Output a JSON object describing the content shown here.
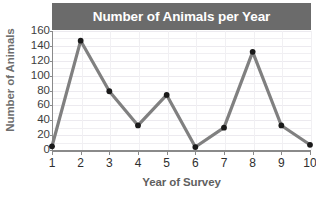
{
  "chart_data": {
    "type": "line",
    "title": "Number of Animals per Year",
    "xlabel": "Year of Survey",
    "ylabel": "Number of Animals",
    "x": [
      1,
      2,
      3,
      4,
      5,
      6,
      7,
      8,
      9,
      10
    ],
    "xticklabels": [
      "1",
      "2",
      "3",
      "4",
      "5",
      "6",
      "7",
      "8",
      "9",
      "10"
    ],
    "values": [
      5,
      147,
      79,
      33,
      74,
      4,
      30,
      132,
      33,
      7
    ],
    "yticks": [
      0,
      20,
      40,
      60,
      80,
      100,
      120,
      140,
      160
    ],
    "yticklabels": [
      "0",
      "20",
      "40",
      "60",
      "80",
      "100",
      "120",
      "140",
      "160"
    ],
    "ylim": [
      0,
      160
    ],
    "xlim": [
      1,
      10
    ],
    "grid": true,
    "legend": "none",
    "series": [
      {
        "name": "Number of Animals",
        "values": [
          5,
          147,
          79,
          33,
          74,
          4,
          30,
          132,
          33,
          7
        ],
        "line_color": "#808080",
        "marker_color": "#1a1a1a",
        "marker": "circle"
      }
    ],
    "colors": {
      "title_banner_bg": "#6b6b6b",
      "title_text": "#ffffff",
      "axis_line": "#8a8a8a",
      "grid_line": "#f0eff2",
      "axis_title_text": "#5f5f5f",
      "tick_label_text": "#2e2e2e",
      "plot_bg": "#ffffff"
    }
  }
}
